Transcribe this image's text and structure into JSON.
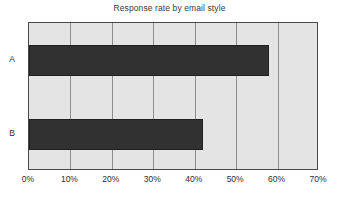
{
  "chart_data": {
    "type": "bar",
    "orientation": "horizontal",
    "title": "Response rate by email style",
    "xlabel": "",
    "ylabel": "",
    "categories": [
      "A",
      "B"
    ],
    "values": [
      58,
      42
    ],
    "value_suffix": "%",
    "xlim": [
      0,
      70
    ],
    "xticks": [
      0,
      10,
      20,
      30,
      40,
      50,
      60,
      70
    ],
    "xtick_labels": [
      "0%",
      "10%",
      "20%",
      "30%",
      "40%",
      "50%",
      "60%",
      "70%"
    ],
    "grid": true,
    "grid_axis": "x",
    "legend": false,
    "colors": {
      "bar": "#313131",
      "plot_background": "#e4e4e4",
      "gridline": "#8d8d8d",
      "axis_border": "#4a4a4a",
      "title_text": "#3a3a3a",
      "tick_text": "#2e2e2e",
      "page_background": "#ffffff"
    }
  }
}
